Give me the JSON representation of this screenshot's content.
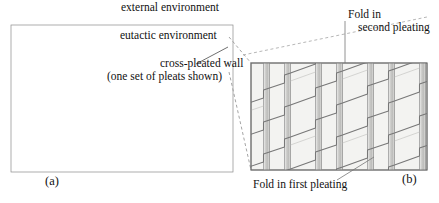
{
  "figure": {
    "title_labels": {
      "external_environment": "external environment",
      "eutactic_environment": "eutactic environment",
      "cross_pleated_wall": "cross-pleated wall",
      "pleats_note": "(one set of pleats shown)",
      "fold_in_second_pleating_line1": "Fold in",
      "fold_in_second_pleating_line2": "second pleating",
      "fold_in_first_pleating": "Fold in first pleating",
      "panel_a": "(a)",
      "panel_b": "(b)"
    },
    "colors": {
      "ink": "#111111",
      "wall_band": "#9a9a9a",
      "panel_fill": "#f2f2f0",
      "fold_band": "#c9c9c7",
      "crease_line": "#6f6f6f",
      "leader_line": "#555555",
      "dashed_connector": "#8a8a8a",
      "background": "#ffffff"
    },
    "panel_a": {
      "name": "chamber-overview",
      "rect": {
        "x": 11,
        "y": 25,
        "width": 222,
        "height": 147
      },
      "border_style": "segmented-pleated-band"
    },
    "panel_b": {
      "name": "pleated-wall-detail",
      "rect": {
        "x": 251,
        "y": 63,
        "width": 176,
        "height": 107
      },
      "vertical_fold_positions": [
        267,
        287,
        318,
        338,
        370,
        390,
        421
      ],
      "diagonal_crease_count": 5,
      "diagonal_rise": 30
    },
    "connectors": {
      "dashed_upper": {
        "x1": 229,
        "y1": 38,
        "x2": 251,
        "y2": 63
      },
      "dashed_lower": {
        "x1": 229,
        "y1": 70,
        "x2": 251,
        "y2": 170
      },
      "leader_cross_pleated_wall": {
        "x1": 196,
        "y1": 64,
        "x2": 228,
        "y2": 47
      },
      "leader_fold_second": {
        "x1": 345,
        "y1": 20,
        "x2": 345,
        "y2": 63
      },
      "leader_fold_first": {
        "x1": 337,
        "y1": 180,
        "x2": 372,
        "y2": 158
      }
    }
  }
}
